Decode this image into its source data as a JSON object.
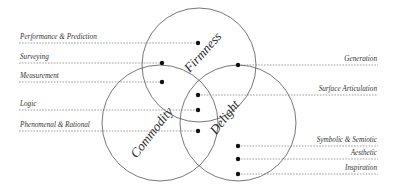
{
  "diagram": {
    "type": "venn",
    "circles": [
      {
        "id": "firmness",
        "label": "Firmness",
        "cx": 199,
        "cy": 65,
        "r": 57,
        "label_x": 206,
        "label_y": 55,
        "label_rotate": -48
      },
      {
        "id": "commodity",
        "label": "Commodity",
        "cx": 160,
        "cy": 123,
        "r": 58,
        "label_x": 155,
        "label_y": 135,
        "label_rotate": -52
      },
      {
        "id": "delight",
        "label": "Delight",
        "cx": 238,
        "cy": 123,
        "r": 58,
        "label_x": 228,
        "label_y": 120,
        "label_rotate": -52
      }
    ],
    "left_labels": [
      {
        "text": "Performance & Prediction",
        "line_y": 43,
        "dot_x": 198
      },
      {
        "text": "Surveying",
        "line_y": 63,
        "dot_x": 162
      },
      {
        "text": "Measurement",
        "line_y": 82,
        "dot_x": 162
      },
      {
        "text": "Logic",
        "line_y": 110,
        "dot_x": 198
      },
      {
        "text": "Phenomenal & Rational",
        "line_y": 131,
        "dot_x": 198
      }
    ],
    "right_labels": [
      {
        "text": "Generation",
        "line_y": 65,
        "dot_x": 238
      },
      {
        "text": "Surface Articulation",
        "line_y": 95,
        "dot_x": 198
      },
      {
        "text": "Symbolic & Semiotic",
        "line_y": 146,
        "dot_x": 238
      },
      {
        "text": "Aesthetic",
        "line_y": 159,
        "dot_x": 238
      },
      {
        "text": "Inspiration",
        "line_y": 174,
        "dot_x": 238
      }
    ]
  }
}
